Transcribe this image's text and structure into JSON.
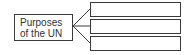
{
  "diagram": {
    "central_node": {
      "line1": "Purposes",
      "line2": "of the UN"
    },
    "branches": [
      {
        "label": ""
      },
      {
        "label": ""
      },
      {
        "label": ""
      }
    ],
    "colors": {
      "stroke": "#3a3a3a",
      "text": "#333333",
      "background": "#ffffff"
    }
  }
}
